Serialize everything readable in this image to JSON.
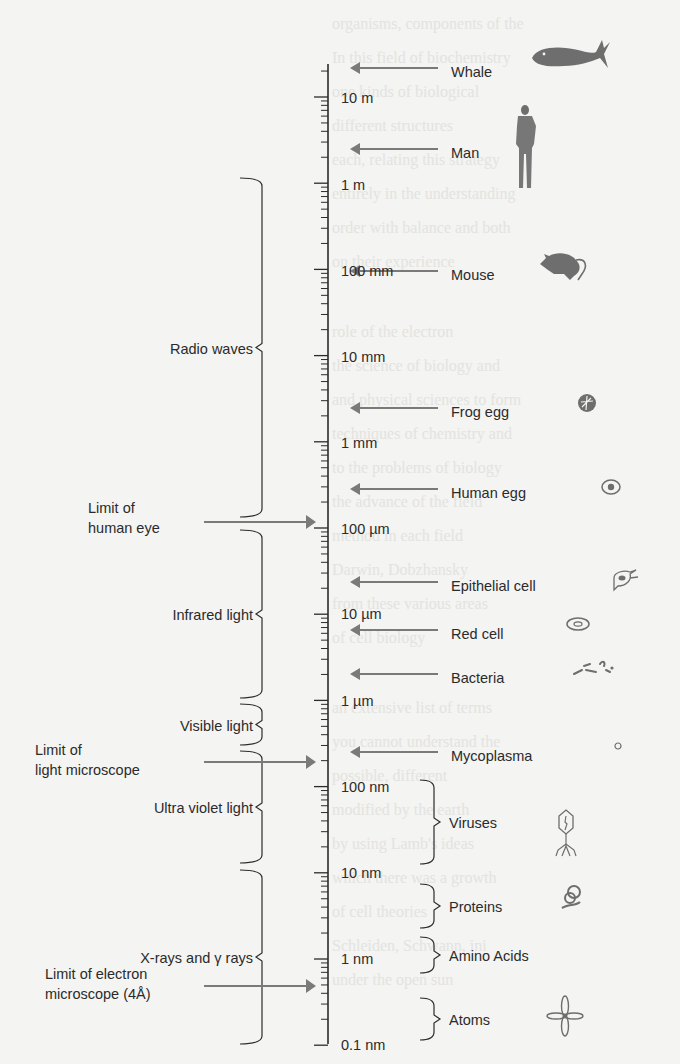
{
  "figure": {
    "axis": {
      "x": 328,
      "top": 64,
      "bottom": 1044,
      "decade_px": 86.2,
      "first_decade_y": 97
    },
    "colors": {
      "ink": "#2b2b2b",
      "arrow": "#7a7a7a",
      "background": "#f4f4f2",
      "drawing": "#6e6e6e"
    },
    "scale_labels": [
      {
        "text": "10 m",
        "y": 97
      },
      {
        "text": "1 m",
        "y": 184
      },
      {
        "text": "100 mm",
        "y": 270
      },
      {
        "text": "10 mm",
        "y": 356
      },
      {
        "text": "1 mm",
        "y": 442
      },
      {
        "text": "100 µm",
        "y": 528
      },
      {
        "text": "10 µm",
        "y": 613
      },
      {
        "text": "1 µm",
        "y": 700
      },
      {
        "text": "100 nm",
        "y": 786
      },
      {
        "text": "10 nm",
        "y": 872
      },
      {
        "text": "1 nm",
        "y": 958
      },
      {
        "text": "0.1 nm",
        "y": 1044
      }
    ],
    "objects_arrows": [
      {
        "label": "Whale",
        "y": 68,
        "icon": "whale-icon"
      },
      {
        "label": "Man",
        "y": 149,
        "icon": "man-icon"
      },
      {
        "label": "Mouse",
        "y": 271,
        "icon": "mouse-icon"
      },
      {
        "label": "Frog egg",
        "y": 408,
        "icon": "frog-egg-icon"
      },
      {
        "label": "Human egg",
        "y": 489,
        "icon": "human-egg-icon"
      },
      {
        "label": "Epithelial cell",
        "y": 582,
        "icon": "epithelial-cell-icon"
      },
      {
        "label": "Red cell",
        "y": 630,
        "icon": "red-cell-icon"
      },
      {
        "label": "Bacteria",
        "y": 674,
        "icon": "bacteria-icon"
      },
      {
        "label": "Mycoplasma",
        "y": 752,
        "icon": "mycoplasma-icon"
      }
    ],
    "objects_brackets": [
      {
        "label": "Viruses",
        "top": 780,
        "bottom": 864,
        "icon": "virus-icon"
      },
      {
        "label": "Proteins",
        "top": 884,
        "bottom": 928,
        "icon": "protein-icon"
      },
      {
        "label": "Amino Acids",
        "top": 937,
        "bottom": 973,
        "icon": "amino-acid-icon"
      },
      {
        "label": "Atoms",
        "top": 998,
        "bottom": 1040,
        "icon": "atom-icon"
      }
    ],
    "radiation_bands": [
      {
        "label": "Radio waves",
        "top": 178,
        "bottom": 517
      },
      {
        "label": "Infrared light",
        "top": 530,
        "bottom": 698
      },
      {
        "label": "Visible light",
        "top": 704,
        "bottom": 745
      },
      {
        "label": "Ultra violet light",
        "top": 751,
        "bottom": 863
      },
      {
        "label": "X-rays and γ rays",
        "top": 870,
        "bottom": 1044
      }
    ],
    "limits": [
      {
        "lines": [
          "Limit of",
          "human eye"
        ],
        "y": 522
      },
      {
        "lines": [
          "Limit of",
          "light microscope"
        ],
        "y": 762
      },
      {
        "lines": [
          "Limit of electron",
          "microscope (4Å)"
        ],
        "y": 986
      }
    ]
  },
  "background_text_lines": [
    "organisms, components of the",
    "In this field of biochemistry",
    "one kinds of biological",
    "different structures",
    "each, relating this strategy",
    "entirely in the understanding",
    "order with balance and both",
    "on their experience",
    "",
    "role of the electron",
    "the science of biology and",
    "and physical sciences to form",
    "techniques of chemistry and",
    "to the problems of biology",
    "the advance of the field",
    "method in each field",
    "Darwin, Dobzhansky",
    "from these various areas",
    "of cell biology",
    "",
    "an extensive list of terms",
    "you cannot understand the",
    "possible, different",
    "modified by the earth",
    "by using Lamb's ideas",
    "which there was a growth",
    "of cell theories",
    "Schleiden, Schwann, ini",
    "under the open sun"
  ]
}
